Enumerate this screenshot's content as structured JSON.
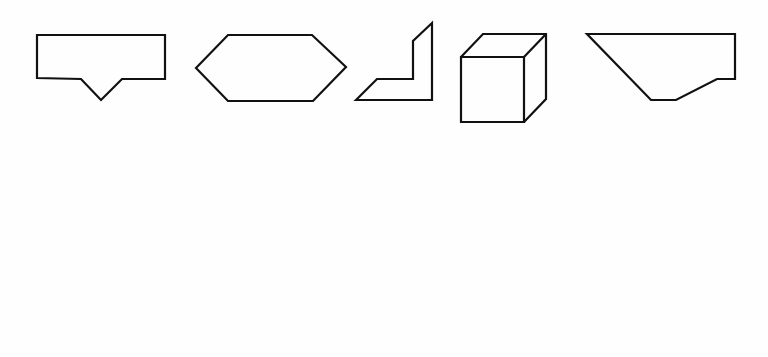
{
  "figure": {
    "options": [
      {
        "label": "A"
      },
      {
        "label": "B"
      },
      {
        "label": "C"
      },
      {
        "label": "D"
      },
      {
        "label": "E"
      }
    ],
    "items": [
      {
        "label": "Item 1"
      },
      {
        "label": "Item 2"
      }
    ],
    "stroke_color": "#111111",
    "background_color": "#ffffff"
  }
}
